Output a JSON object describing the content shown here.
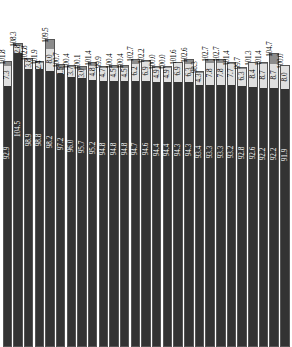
{
  "chart_data": {
    "type": "bar",
    "subtype": "stacked-bar",
    "title": "",
    "xlabel": "",
    "ylabel": "",
    "grid": false,
    "legend": false,
    "ylim": [
      0,
      110
    ],
    "stack_order": [
      "base",
      "middle",
      "top"
    ],
    "colors": {
      "base": "#333333",
      "middle": "#e0e0e0",
      "top": "#8c8c8c",
      "background": "#ffffff",
      "base_label": "#ffffff",
      "label": "#000000"
    },
    "categories": [
      "1",
      "2",
      "3",
      "4",
      "5",
      "6",
      "7",
      "8",
      "9",
      "10",
      "11",
      "12",
      "13",
      "14",
      "15",
      "16",
      "17",
      "18",
      "19",
      "20",
      "21",
      "22",
      "23",
      "24"
    ],
    "series": [
      {
        "name": "base",
        "values": [
          92.9,
          104.5,
          98.9,
          98.8,
          98.2,
          97.2,
          96.0,
          95.7,
          95.2,
          94.8,
          94.8,
          94.8,
          94.7,
          94.6,
          94.4,
          94.4,
          94.3,
          94.3,
          93.4,
          93.3,
          93.3,
          93.2,
          92.8,
          92.6
        ]
      },
      {
        "name": "middle",
        "values": [
          7.3,
          2.8,
          3.8,
          2.4,
          8.0,
          1.5,
          3.7,
          3.0,
          4.8,
          4.7,
          4.5,
          4.5,
          6.2,
          6.9,
          4.9,
          4.9,
          6.9,
          6.3,
          4.3,
          7.8,
          7.8,
          7.7,
          6.3,
          8.4
        ]
      },
      {
        "name": "top",
        "values": [
          1.6,
          1.0,
          0.1,
          0.7,
          3.3,
          2.0,
          0.7,
          1.4,
          1.4,
          0.4,
          1.1,
          0.7,
          1.8,
          0.7,
          0.7,
          0.7,
          0.4,
          1.4,
          0.6,
          1.6,
          1.6,
          0.5,
          0.6,
          0.3
        ]
      }
    ],
    "bars": [
      {
        "index": 1,
        "base": 92.9,
        "middle": 7.3,
        "total": 101.8
      },
      {
        "index": 2,
        "base": 104.5,
        "middle": 2.8,
        "total": 108.3
      },
      {
        "index": 3,
        "base": 98.9,
        "middle": 3.8,
        "total": 102.8
      },
      {
        "index": 4,
        "base": 98.8,
        "middle": 2.4,
        "total": 101.9
      },
      {
        "index": 5,
        "base": 98.2,
        "middle": 8.0,
        "total": 109.5
      },
      {
        "index": 6,
        "base": 97.2,
        "middle": 1.5,
        "total": 100.7
      },
      {
        "index": 7,
        "base": 96.0,
        "middle": 3.7,
        "total": 100.4
      },
      {
        "index": 8,
        "base": 95.7,
        "middle": 3.0,
        "total": 100.1
      },
      {
        "index": 9,
        "base": 95.2,
        "middle": 4.8,
        "total": 101.4
      },
      {
        "index": 10,
        "base": 94.8,
        "middle": 4.7,
        "total": 99.9
      },
      {
        "index": 11,
        "base": 94.8,
        "middle": 4.5,
        "total": 100.4
      },
      {
        "index": 12,
        "base": 94.8,
        "middle": 4.5,
        "total": 100.4
      },
      {
        "index": 13,
        "base": 94.7,
        "middle": 6.2,
        "total": 102.7
      },
      {
        "index": 14,
        "base": 94.6,
        "middle": 6.9,
        "total": 102.2
      },
      {
        "index": 15,
        "base": 94.4,
        "middle": 4.9,
        "total": 100.0
      },
      {
        "index": 16,
        "base": 94.4,
        "middle": 4.9,
        "total": 100.0
      },
      {
        "index": 17,
        "base": 94.3,
        "middle": 6.9,
        "total": 101.6
      },
      {
        "index": 18,
        "base": 94.3,
        "middle": 6.3,
        "total": 102.6
      },
      {
        "index": 19,
        "base": 93.4,
        "middle": 4.3,
        "total": 98.3
      },
      {
        "index": 20,
        "base": 93.3,
        "middle": 7.8,
        "total": 102.7
      },
      {
        "index": 21,
        "base": 93.3,
        "middle": 7.8,
        "total": 102.7
      },
      {
        "index": 22,
        "base": 93.2,
        "middle": 7.7,
        "total": 101.4
      },
      {
        "index": 23,
        "base": 92.8,
        "middle": 6.3,
        "total": 99.7
      },
      {
        "index": 24,
        "base": 92.6,
        "middle": 8.4,
        "total": 101.3
      },
      {
        "index": 25,
        "base": 92.2,
        "middle": 8.7,
        "total": 101.4
      },
      {
        "index": 26,
        "base": 92.2,
        "middle": 8.7,
        "total": 104.7
      },
      {
        "index": 27,
        "base": 91.9,
        "middle": 8.0,
        "total": 100.0
      }
    ]
  }
}
